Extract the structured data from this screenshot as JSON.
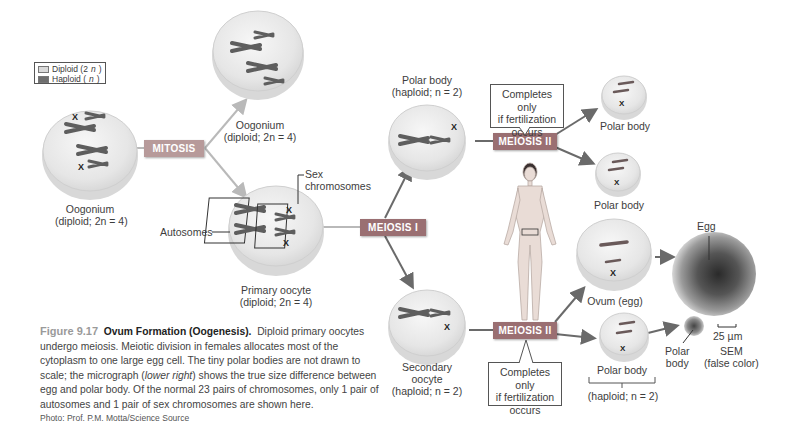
{
  "figure": {
    "number": "Figure 9.17",
    "title": "Ovum Formation (Oogenesis).",
    "caption_parts": [
      "Diploid primary oocytes undergo meiosis. Meiotic division in females allocates most of the cytoplasm to one large egg cell. The tiny polar bodies are not drawn to scale; the micrograph (",
      "lower right",
      ") shows the true size difference between egg and polar body. Of the normal 23 pairs of chromosomes, only 1 pair of autosomes and 1 pair of sex chromosomes are shown here."
    ],
    "credit": "Photo: Prof. P.M. Motta/Science Source"
  },
  "legend": {
    "items": [
      {
        "label": "Diploid (2",
        "var": "n",
        "suffix": ")",
        "color": "#d9d9d9"
      },
      {
        "label": "Haploid (",
        "var": "n",
        "suffix": ")",
        "color": "#6e6e6e"
      }
    ]
  },
  "processes": {
    "mitosis": "MITOSIS",
    "meiosis_1": "MEIOSIS I",
    "meiosis_2_top": "MEIOSIS II",
    "meiosis_2_bottom": "MEIOSIS II"
  },
  "callouts": {
    "top": [
      "Completes only",
      "if fertilization",
      "occurs"
    ],
    "bottom": [
      "Completes only",
      "if fertilization",
      "occurs"
    ]
  },
  "cells": {
    "oogonium_left": {
      "name": "Oogonium",
      "ploidy": "(diploid; 2n = 4)"
    },
    "oogonium_top": {
      "name": "Oogonium",
      "ploidy": "(diploid; 2n = 4)"
    },
    "primary_oocyte": {
      "name": "Primary oocyte",
      "ploidy": "(diploid; 2n = 4)"
    },
    "polar_body_1": {
      "name": "Polar body",
      "ploidy": "(haploid; n = 2)"
    },
    "secondary_oocyte": {
      "name1": "Secondary",
      "name2": "oocyte",
      "ploidy": "(haploid; n = 2)"
    },
    "polar_body_2a": {
      "name": "Polar body"
    },
    "polar_body_2b": {
      "name": "Polar body"
    },
    "ovum": {
      "name": "Ovum (egg)"
    },
    "polar_body_3": {
      "name": "Polar body",
      "ploidy": "(haploid; n = 2)"
    }
  },
  "annotations": {
    "sex_chromosomes": [
      "Sex",
      "chromosomes"
    ],
    "autosomes": "Autosomes",
    "x_marker": "X"
  },
  "micrograph": {
    "egg_label": "Egg",
    "polar_label": [
      "Polar",
      "body"
    ],
    "scale": "25 µm",
    "method": [
      "SEM",
      "(false color)"
    ]
  },
  "colors": {
    "mitosis_box": "#b79a9a",
    "meiosis_box": "#9a6f72",
    "arrow_light": "#b9b9b9",
    "arrow_dark": "#6a6a6a",
    "chromosome": "#5e5e5e"
  }
}
